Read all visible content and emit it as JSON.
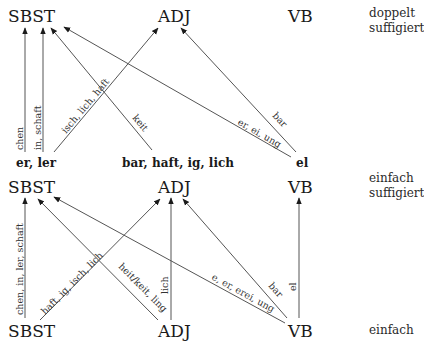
{
  "rows": {
    "top": {
      "nodes": [
        "SBST",
        "ADJ",
        "VB"
      ],
      "side_label_line1": "doppelt",
      "side_label_line2": "suffigiert"
    },
    "middle_sources": [
      "er, ler",
      "bar, haft, ig, lich",
      "el"
    ],
    "middle": {
      "nodes": [
        "SBST",
        "ADJ",
        "VB"
      ],
      "side_label_line1": "einfach",
      "side_label_line2": "suffigiert"
    },
    "bottom": {
      "nodes": [
        "SBST",
        "ADJ",
        "VB"
      ],
      "side_label_line1": "einfach"
    }
  },
  "edges_upper": [
    {
      "from": "er, ler",
      "to": "SBST",
      "label": "chen"
    },
    {
      "from": "er, ler",
      "to": "SBST",
      "label": "in, schaft"
    },
    {
      "from": "er, ler",
      "to": "ADJ",
      "label": "isch, lich, haft"
    },
    {
      "from": "bar, haft, ig, lich",
      "to": "SBST",
      "label": "keit"
    },
    {
      "from": "el",
      "to": "SBST",
      "label": "er, ei, ung"
    },
    {
      "from": "el",
      "to": "ADJ",
      "label": "bar"
    }
  ],
  "edges_lower": [
    {
      "from": "SBST",
      "to": "SBST",
      "label": "chen, in, ler, schaft"
    },
    {
      "from": "SBST",
      "to": "ADJ",
      "label": "haft, ig, isch, lich"
    },
    {
      "from": "ADJ",
      "to": "SBST",
      "label": "heit/keit, ling"
    },
    {
      "from": "ADJ",
      "to": "ADJ",
      "label": "lich"
    },
    {
      "from": "VB",
      "to": "SBST",
      "label": "e, er, erei, ung"
    },
    {
      "from": "VB",
      "to": "ADJ",
      "label": "bar"
    },
    {
      "from": "VB",
      "to": "VB",
      "label": "el"
    }
  ]
}
